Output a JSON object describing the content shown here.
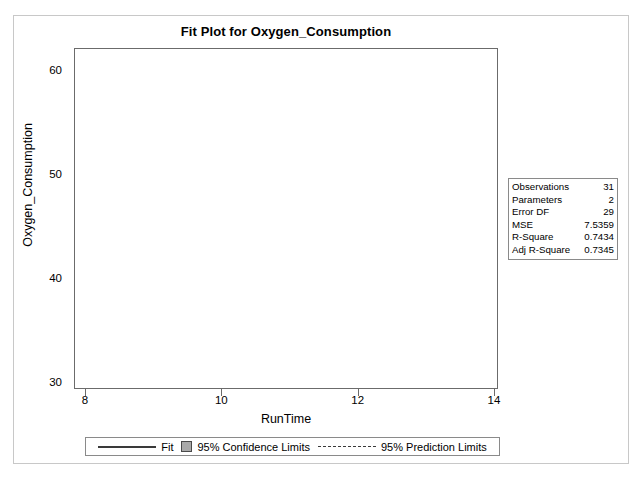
{
  "title": "Fit Plot for Oxygen_Consumption",
  "axis": {
    "xlabel": "RunTime",
    "ylabel": "Oxygen_Consumption"
  },
  "stats": {
    "rows": [
      {
        "label": "Observations",
        "value": "31"
      },
      {
        "label": "Parameters",
        "value": "2"
      },
      {
        "label": "Error DF",
        "value": "29"
      },
      {
        "label": "MSE",
        "value": "7.5359"
      },
      {
        "label": "R-Square",
        "value": "0.7434"
      },
      {
        "label": "Adj R-Square",
        "value": "0.7345"
      }
    ]
  },
  "legend": {
    "fit": "Fit",
    "confidence": "95% Confidence Limits",
    "prediction": "95% Prediction Limits"
  },
  "colors": {
    "fit_line": "#3a3a3a",
    "confidence_band": "#a9a9a9",
    "prediction_line": "#3a3a3a",
    "marker": "#222222",
    "frame": "#6b6b6b",
    "page_border": "#c8c8c8"
  },
  "chart_data": {
    "type": "scatter",
    "title": "Fit Plot for Oxygen_Consumption",
    "xlabel": "RunTime",
    "ylabel": "Oxygen_Consumption",
    "xlim": [
      8,
      14
    ],
    "ylim": [
      30,
      60
    ],
    "xticks": [
      8,
      10,
      12,
      14
    ],
    "yticks": [
      30,
      40,
      50,
      60
    ],
    "grid": false,
    "legend_position": "bottom",
    "n_observations": 31,
    "points": [
      {
        "x": 8.17,
        "y": 59.6
      },
      {
        "x": 8.65,
        "y": 60.1
      },
      {
        "x": 8.63,
        "y": 54.3
      },
      {
        "x": 8.92,
        "y": 54.6
      },
      {
        "x": 8.95,
        "y": 49.2
      },
      {
        "x": 9.22,
        "y": 49.9
      },
      {
        "x": 9.4,
        "y": 48.7
      },
      {
        "x": 9.63,
        "y": 45.4
      },
      {
        "x": 9.93,
        "y": 50.5
      },
      {
        "x": 10.0,
        "y": 46.7
      },
      {
        "x": 10.07,
        "y": 50.5
      },
      {
        "x": 10.13,
        "y": 50.6
      },
      {
        "x": 10.08,
        "y": 45.3
      },
      {
        "x": 10.25,
        "y": 46.8
      },
      {
        "x": 10.33,
        "y": 51.9
      },
      {
        "x": 10.47,
        "y": 45.8
      },
      {
        "x": 10.5,
        "y": 47.5
      },
      {
        "x": 10.6,
        "y": 47.3
      },
      {
        "x": 10.85,
        "y": 49.2
      },
      {
        "x": 10.95,
        "y": 40.8
      },
      {
        "x": 11.08,
        "y": 46.1
      },
      {
        "x": 11.12,
        "y": 44.8
      },
      {
        "x": 11.17,
        "y": 44.6
      },
      {
        "x": 11.37,
        "y": 44.2
      },
      {
        "x": 11.63,
        "y": 44.6
      },
      {
        "x": 11.95,
        "y": 45.8
      },
      {
        "x": 11.85,
        "y": 48.0
      },
      {
        "x": 12.63,
        "y": 39.4
      },
      {
        "x": 12.88,
        "y": 39.2
      },
      {
        "x": 13.08,
        "y": 39.4
      },
      {
        "x": 14.03,
        "y": 37.4
      }
    ],
    "fit": {
      "label": "Fit",
      "intercept": 80.2,
      "slope": -3.13,
      "x_range": [
        8.05,
        14.05
      ],
      "y_range": [
        55.0,
        36.2
      ]
    },
    "confidence_limits": {
      "label": "95% Confidence Limits",
      "level": 0.95,
      "x": [
        8.05,
        9.0,
        10.0,
        11.0,
        12.0,
        13.0,
        14.05
      ],
      "lower": [
        53.0,
        50.4,
        47.5,
        44.3,
        40.9,
        37.5,
        33.9
      ],
      "upper": [
        57.1,
        53.6,
        50.2,
        46.9,
        43.6,
        40.4,
        38.4
      ]
    },
    "prediction_limits": {
      "label": "95% Prediction Limits",
      "level": 0.95,
      "x": [
        8.05,
        14.05
      ],
      "lower": [
        49.0,
        30.1
      ],
      "upper": [
        61.2,
        42.5
      ]
    }
  }
}
